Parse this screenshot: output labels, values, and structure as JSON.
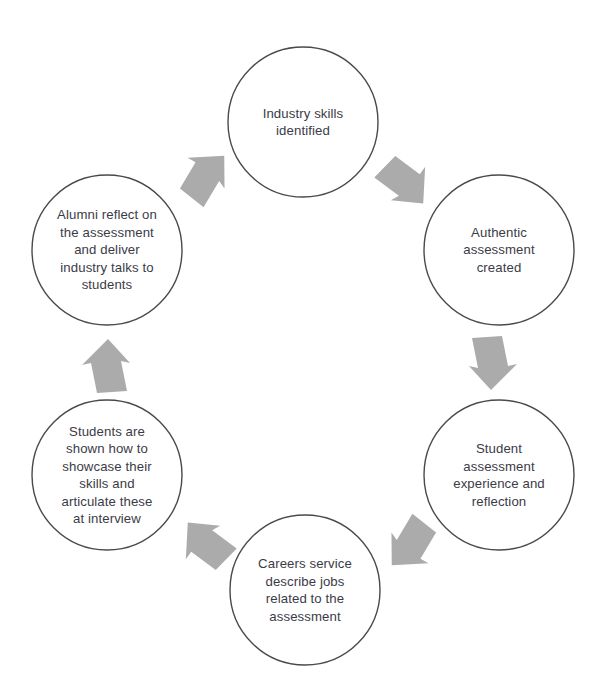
{
  "diagram": {
    "type": "cycle",
    "title": "",
    "background_color": "#ffffff",
    "circle_stroke_color": "#4a4a4a",
    "circle_fill_color": "#ffffff",
    "arrow_color": "#ababab",
    "text_color": "#3b3b46",
    "nodes": [
      {
        "id": "industry-skills",
        "position": "top",
        "text": "Industry skills\nidentified",
        "cx": 303,
        "cy": 122,
        "r": 75
      },
      {
        "id": "authentic-assessment",
        "position": "top-right",
        "text": "Authentic\nassessment\ncreated",
        "cx": 499,
        "cy": 250,
        "r": 75
      },
      {
        "id": "student-experience",
        "position": "bottom-right",
        "text": "Student\nassessment\nexperience and\nreflection",
        "cx": 499,
        "cy": 475,
        "r": 75
      },
      {
        "id": "careers-service",
        "position": "bottom",
        "text": "Careers service\ndescribe jobs\nrelated to the\nassessment",
        "cx": 305,
        "cy": 590,
        "r": 75
      },
      {
        "id": "students-showcase",
        "position": "bottom-left",
        "text": "Students are\nshown how to\nshowcase their\nskills and\narticulate these\nat interview",
        "cx": 107,
        "cy": 475,
        "r": 75
      },
      {
        "id": "alumni-reflect",
        "position": "top-left",
        "text": "Alumni reflect on\nthe assessment\nand deliver\nindustry talks to\nstudents",
        "cx": 107,
        "cy": 250,
        "r": 75
      }
    ],
    "arrows": [
      {
        "id": "alumni-to-industry",
        "from": "alumni-reflect",
        "to": "industry-skills",
        "direction": "up-right",
        "cx": 207,
        "cy": 178,
        "rotation": -48
      },
      {
        "id": "industry-to-authentic",
        "from": "industry-skills",
        "to": "authentic-assessment",
        "direction": "down-right",
        "cx": 403,
        "cy": 184,
        "rotation": 48
      },
      {
        "id": "authentic-to-student",
        "from": "authentic-assessment",
        "to": "student-experience",
        "direction": "down",
        "cx": 489,
        "cy": 362,
        "rotation": 90
      },
      {
        "id": "student-to-careers",
        "from": "student-experience",
        "to": "careers-service",
        "direction": "down-left",
        "cx": 409,
        "cy": 543,
        "rotation": 132
      },
      {
        "id": "careers-to-students",
        "from": "careers-service",
        "to": "students-showcase",
        "direction": "up-left",
        "cx": 208,
        "cy": 542,
        "rotation": -132
      },
      {
        "id": "students-to-alumni",
        "from": "students-showcase",
        "to": "alumni-reflect",
        "direction": "up",
        "cx": 110,
        "cy": 367,
        "rotation": -90
      }
    ]
  }
}
